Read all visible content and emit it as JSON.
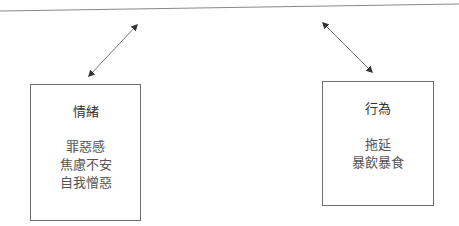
{
  "diagram": {
    "colors": {
      "line": "#666666",
      "box_border": "#6e6e6e",
      "text": "#333333"
    },
    "boxes": [
      {
        "title": "情緒",
        "items": [
          "罪惡感",
          "焦慮不安",
          "自我憎惡"
        ]
      },
      {
        "title": "行為",
        "items": [
          "拖延",
          "暴飲暴食"
        ]
      }
    ],
    "arrows": [
      {
        "type": "bidirectional",
        "from": "left-box",
        "to": "upper-off-screen"
      },
      {
        "type": "bidirectional",
        "from": "upper-off-screen",
        "to": "right-box"
      }
    ]
  }
}
